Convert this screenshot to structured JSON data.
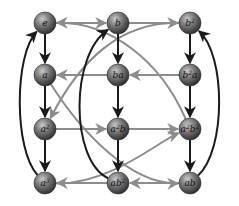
{
  "diagram": {
    "type": "cayley-graph",
    "colors": {
      "primary_edge": "#1a1a1a",
      "secondary_edge": "#8c8c8c",
      "node_fill_light": "#b8b8b8",
      "node_fill_dark": "#3a3a3a"
    },
    "nodes": [
      {
        "id": "e",
        "label": "e",
        "base": "e",
        "sup": "",
        "tail": "",
        "tail_sup": "",
        "x": 45,
        "y": 23
      },
      {
        "id": "b",
        "label": "b",
        "base": "b",
        "sup": "",
        "tail": "",
        "tail_sup": "",
        "x": 118,
        "y": 23
      },
      {
        "id": "b2",
        "label": "b²",
        "base": "b",
        "sup": "2",
        "tail": "",
        "tail_sup": "",
        "x": 190,
        "y": 23
      },
      {
        "id": "a",
        "label": "a",
        "base": "a",
        "sup": "",
        "tail": "",
        "tail_sup": "",
        "x": 45,
        "y": 75
      },
      {
        "id": "ba",
        "label": "ba",
        "base": "ba",
        "sup": "",
        "tail": "",
        "tail_sup": "",
        "x": 118,
        "y": 75
      },
      {
        "id": "b2a",
        "label": "b²a",
        "base": "b",
        "sup": "2",
        "tail": "a",
        "tail_sup": "",
        "x": 190,
        "y": 75
      },
      {
        "id": "a2",
        "label": "a²",
        "base": "a",
        "sup": "2",
        "tail": "",
        "tail_sup": "",
        "x": 45,
        "y": 129
      },
      {
        "id": "a2b",
        "label": "a²b",
        "base": "a",
        "sup": "2",
        "tail": "b",
        "tail_sup": "",
        "x": 118,
        "y": 129
      },
      {
        "id": "a2b2",
        "label": "a²b²",
        "base": "a",
        "sup": "2",
        "tail": "b",
        "tail_sup": "2",
        "x": 190,
        "y": 129
      },
      {
        "id": "a3",
        "label": "a³",
        "base": "a",
        "sup": "3",
        "tail": "",
        "tail_sup": "",
        "x": 45,
        "y": 183
      },
      {
        "id": "ab2",
        "label": "ab²",
        "base": "ab",
        "sup": "2",
        "tail": "",
        "tail_sup": "",
        "x": 118,
        "y": 183
      },
      {
        "id": "ab",
        "label": "ab",
        "base": "ab",
        "sup": "",
        "tail": "",
        "tail_sup": "",
        "x": 190,
        "y": 183
      }
    ],
    "edges": [
      {
        "from": "e",
        "to": "a",
        "generator": "a",
        "color": "primary"
      },
      {
        "from": "a",
        "to": "a2",
        "generator": "a",
        "color": "primary"
      },
      {
        "from": "a2",
        "to": "a3",
        "generator": "a",
        "color": "primary"
      },
      {
        "from": "a3",
        "to": "e",
        "generator": "a",
        "color": "primary",
        "curve": "outer-left"
      },
      {
        "from": "b",
        "to": "ba",
        "generator": "a",
        "color": "primary"
      },
      {
        "from": "ba",
        "to": "a2b",
        "generator": "a",
        "color": "primary"
      },
      {
        "from": "a2b",
        "to": "ab2",
        "generator": "a",
        "color": "primary"
      },
      {
        "from": "ab2",
        "to": "b",
        "generator": "a",
        "color": "primary",
        "curve": "inner"
      },
      {
        "from": "b2",
        "to": "b2a",
        "generator": "a",
        "color": "primary"
      },
      {
        "from": "b2a",
        "to": "a2b2",
        "generator": "a",
        "color": "primary"
      },
      {
        "from": "a2b2",
        "to": "ab",
        "generator": "a",
        "color": "primary"
      },
      {
        "from": "ab",
        "to": "b2",
        "generator": "a",
        "color": "primary",
        "curve": "outer-right"
      },
      {
        "from": "e",
        "to": "b",
        "generator": "b",
        "color": "secondary"
      },
      {
        "from": "b",
        "to": "b2",
        "generator": "b",
        "color": "secondary"
      },
      {
        "from": "b2",
        "to": "a2",
        "generator": "b",
        "color": "secondary",
        "curve": "diagonal"
      },
      {
        "from": "b2a",
        "to": "ba",
        "generator": "b",
        "color": "secondary"
      },
      {
        "from": "ba",
        "to": "a",
        "generator": "b",
        "color": "secondary"
      },
      {
        "from": "a",
        "to": "ab",
        "generator": "b",
        "color": "secondary",
        "curve": "diagonal"
      },
      {
        "from": "a2",
        "to": "a2b",
        "generator": "b",
        "color": "secondary"
      },
      {
        "from": "a2b",
        "to": "a2b2",
        "generator": "b",
        "color": "secondary"
      },
      {
        "from": "a2b2",
        "to": "e",
        "generator": "b",
        "color": "secondary",
        "curve": "diagonal"
      },
      {
        "from": "ab",
        "to": "ab2",
        "generator": "b",
        "color": "secondary"
      },
      {
        "from": "ab2",
        "to": "a3",
        "generator": "b",
        "color": "secondary"
      },
      {
        "from": "a3",
        "to": "a2b2",
        "generator": "b",
        "color": "secondary",
        "curve": "diagonal"
      }
    ]
  }
}
